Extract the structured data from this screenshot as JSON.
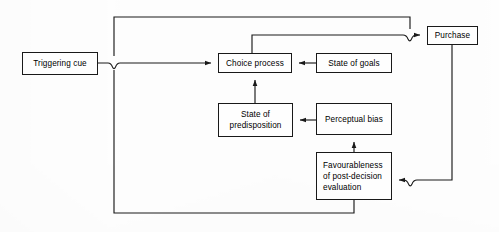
{
  "figure": {
    "type": "flow-diagram",
    "width": 499,
    "height": 232,
    "background_color": "#fefefe",
    "line_color": "#1a1a1a",
    "text_color": "#000000"
  },
  "nodes": {
    "triggering_cue": {
      "label": "Triggering cue"
    },
    "choice_process": {
      "label": "Choice process"
    },
    "state_of_goals": {
      "label": "State of goals"
    },
    "purchase": {
      "label": "Purchase"
    },
    "state_of_predisposition": {
      "label": "State of\npredisposition"
    },
    "perceptual_bias": {
      "label": "Perceptual bias"
    },
    "favourableness": {
      "label": "Favourableness\nof post-decision\nevaluation"
    }
  },
  "edges": [
    {
      "name": "triggering-cue-to-choice-process",
      "from": "triggering_cue",
      "to": "choice_process",
      "arrow": "to",
      "crossing_hop": true
    },
    {
      "name": "state-of-goals-to-choice-process",
      "from": "state_of_goals",
      "to": "choice_process",
      "arrow": "to"
    },
    {
      "name": "state-of-predisposition-to-choice-process",
      "from": "state_of_predisposition",
      "to": "choice_process",
      "arrow": "to"
    },
    {
      "name": "perceptual-bias-to-state-of-predisposition",
      "from": "perceptual_bias",
      "to": "state_of_predisposition",
      "arrow": "to"
    },
    {
      "name": "favourableness-to-perceptual-bias",
      "from": "favourableness",
      "to": "perceptual_bias",
      "arrow": "to"
    },
    {
      "name": "choice-process-to-purchase",
      "from": "choice_process",
      "to": "purchase",
      "arrow": "to",
      "crossing_hop": true
    },
    {
      "name": "purchase-to-favourableness",
      "from": "purchase",
      "to": "favourableness",
      "arrow": "to",
      "crossing_hop": true
    },
    {
      "name": "feedback-loop-outer",
      "from": "favourableness",
      "to": "choice_process",
      "arrow": "none",
      "shape": "rectangular-loop"
    }
  ]
}
